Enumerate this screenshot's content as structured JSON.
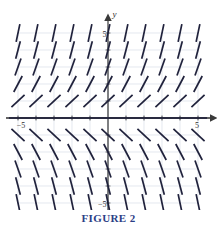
{
  "figure": {
    "caption": "FIGURE 2",
    "caption_color": "#2b3e86"
  },
  "colors": {
    "background": "#ffffff",
    "grid_line": "#c8cfdc",
    "grid_line_alt": "#d9dee8",
    "axis": "#4a4a4a",
    "axis_strong": "#2f2f2f",
    "slope_mark": "#20223c",
    "caption": "#2b3e86"
  },
  "axes": {
    "x_label": "x",
    "y_label": "y",
    "x_tick_pos_label": "5",
    "x_tick_neg_label": "−5",
    "y_tick_pos_label": "5",
    "y_tick_neg_label": "−5",
    "x_min": -5,
    "x_max": 5,
    "y_min": -5,
    "y_max": 5,
    "tick_step": 1,
    "grid": true,
    "arrowheads": [
      "x-positive",
      "y-positive"
    ]
  },
  "chart_data": {
    "type": "scatter",
    "title": "FIGURE 2",
    "subtitle": "",
    "xlabel": "x",
    "ylabel": "y",
    "xlim": [
      -5,
      5
    ],
    "ylim": [
      -5,
      5
    ],
    "grid": true,
    "legend": "none",
    "plot_kind": "direction-field",
    "slope_rule": "dy/dx = y",
    "segment_length": 0.62,
    "x": [
      -5,
      -4,
      -3,
      -2,
      -1,
      0,
      1,
      2,
      3,
      4,
      5
    ],
    "y": [
      5,
      4,
      3,
      2,
      1,
      0,
      -1,
      -2,
      -3,
      -4,
      -5
    ],
    "row_slopes": [
      {
        "y": 5,
        "slope": 5
      },
      {
        "y": 4,
        "slope": 4
      },
      {
        "y": 3,
        "slope": 3
      },
      {
        "y": 2,
        "slope": 2
      },
      {
        "y": 1,
        "slope": 1
      },
      {
        "y": 0,
        "slope": 0
      },
      {
        "y": -1,
        "slope": -1
      },
      {
        "y": -2,
        "slope": -2
      },
      {
        "y": -3,
        "slope": -3
      },
      {
        "y": -4,
        "slope": -4
      },
      {
        "y": -5,
        "slope": -5
      }
    ],
    "annotations": []
  }
}
